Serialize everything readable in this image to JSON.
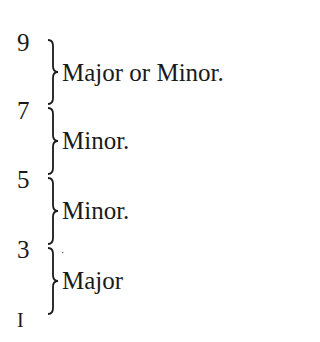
{
  "intervals": [
    {
      "upper": "9",
      "lower": "7",
      "label": "Major or Minor."
    },
    {
      "upper": "7",
      "lower": "5",
      "label": "Minor."
    },
    {
      "upper": "5",
      "lower": "3",
      "label": "Minor."
    },
    {
      "upper": "3",
      "lower": "1",
      "label": "Major"
    }
  ],
  "numbers": [
    "9",
    "7",
    "5",
    "3",
    "I"
  ],
  "stray_mark": "·"
}
